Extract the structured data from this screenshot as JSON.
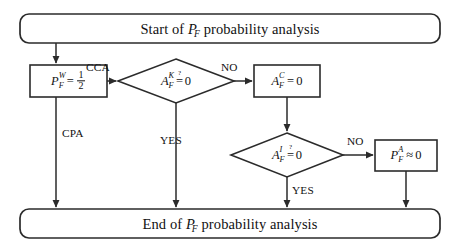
{
  "figure": {
    "colors": {
      "stroke": "#2b2b2b",
      "text": "#111111",
      "background": "#ffffff"
    }
  },
  "terminals": {
    "start": {
      "id": "start-terminal",
      "prefix": "Start of",
      "var_base": "P",
      "var_sub": "F",
      "suffix": "probability analysis",
      "plain": "Start of P_F probability analysis"
    },
    "end": {
      "id": "end-terminal",
      "prefix": "End of",
      "var_base": "P",
      "var_sub": "F",
      "suffix": "probability analysis",
      "plain": "End of P_F probability analysis"
    }
  },
  "process_nodes": [
    {
      "id": "pfw-node",
      "var_base": "P",
      "sup": "W",
      "sub": "F",
      "operator": "=",
      "value_num": "1",
      "value_den": "2",
      "plain": "P_F^W = 1/2"
    },
    {
      "id": "afc-node",
      "var_base": "A",
      "sup": "C",
      "sub": "F",
      "operator": "=",
      "value": "0",
      "plain": "A_F^C = 0"
    },
    {
      "id": "pfa-node",
      "var_base": "P",
      "sup": "A",
      "sub": "F",
      "operator": "≈",
      "value": "0",
      "plain": "P_F^A ≈ 0"
    }
  ],
  "decision_nodes": [
    {
      "id": "afk-decision",
      "var_base": "A",
      "sup": "K",
      "sub": "F",
      "query": "?",
      "operator": "=",
      "value": "0",
      "plain": "A_F^K =? 0"
    },
    {
      "id": "afi-decision",
      "var_base": "A",
      "sup": "I",
      "sub": "F",
      "query": "?",
      "operator": "=",
      "value": "0",
      "plain": "A_F^I =? 0"
    }
  ],
  "edge_labels": [
    {
      "id": "cca-label",
      "text": "CCA"
    },
    {
      "id": "cpa-label",
      "text": "CPA"
    },
    {
      "id": "no-label-1",
      "text": "NO"
    },
    {
      "id": "yes-label-1",
      "text": "YES"
    },
    {
      "id": "no-label-2",
      "text": "NO"
    },
    {
      "id": "yes-label-2",
      "text": "YES"
    }
  ]
}
